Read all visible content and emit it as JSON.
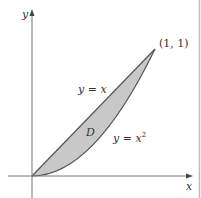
{
  "figure": {
    "axes": {
      "x_label": "x",
      "y_label": "y"
    },
    "curves": [
      {
        "name": "line",
        "label_var": "y",
        "label_eq": " = ",
        "label_rhs": "x",
        "equation": "y = x"
      },
      {
        "name": "parabola",
        "label_var": "y",
        "label_eq": " = ",
        "label_rhs": "x",
        "label_sup": "2",
        "equation": "y = x^2"
      }
    ],
    "region": {
      "label": "D",
      "fill": "#c8c8c8"
    },
    "point": {
      "label": "(1, 1)"
    },
    "colors": {
      "stroke": "#555555",
      "fill": "#c8c8c8",
      "border": "#bbbbbb"
    }
  }
}
